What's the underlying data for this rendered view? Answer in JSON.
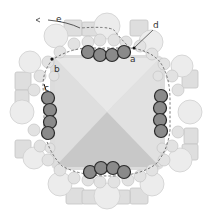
{
  "diagram": {
    "type": "beadwork-bezel-diagram",
    "labels": {
      "a": "a",
      "b": "b",
      "c": "c",
      "d": "d",
      "e": "e"
    },
    "colors": {
      "background": "#ffffff",
      "stone_top": "#e4e4e4",
      "stone_left": "#d8d8d8",
      "stone_right": "#dcdcdc",
      "stone_bottom": "#c6c6c6",
      "light_bead": "#e2e2e2",
      "light_bead_stroke": "#c8c8c8",
      "dark_bead": "#8a8a8a",
      "dark_bead_stroke": "#2a2a2a",
      "thread_path": "#555555"
    },
    "highlighted_bead_groups": [
      {
        "side": "top",
        "count": 4
      },
      {
        "side": "left",
        "count": 4
      },
      {
        "side": "right",
        "count": 4
      },
      {
        "side": "bottom",
        "count": 4
      }
    ]
  }
}
